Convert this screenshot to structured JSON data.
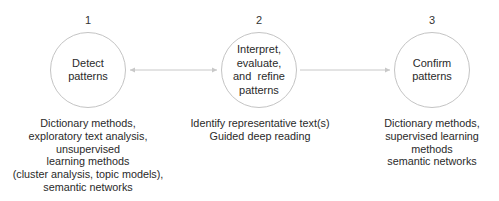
{
  "diagram": {
    "colors": {
      "node_border": "#c4c4c4",
      "arrow": "#c8c8c8",
      "text": "#2a2a2a"
    },
    "steps": [
      {
        "number": "1",
        "label_lines": [
          "Detect",
          "patterns"
        ],
        "methods_lines": [
          "Dictionary methods,",
          "exploratory text analysis,",
          "unsupervised",
          "learning methods",
          "(cluster analysis, topic models),",
          "semantic networks"
        ]
      },
      {
        "number": "2",
        "label_lines": [
          "Interpret,",
          "evaluate,",
          "and  refine",
          "patterns"
        ],
        "methods_lines": [
          "Identify representative text(s)",
          "Guided deep reading"
        ]
      },
      {
        "number": "3",
        "label_lines": [
          "Confirm",
          "patterns"
        ],
        "methods_lines": [
          "Dictionary methods,",
          "supervised learning",
          "methods",
          "semantic networks"
        ]
      }
    ],
    "connectors": [
      {
        "from": "1",
        "to": "2",
        "direction": "bidirectional"
      },
      {
        "from": "2",
        "to": "3",
        "direction": "forward"
      }
    ]
  }
}
